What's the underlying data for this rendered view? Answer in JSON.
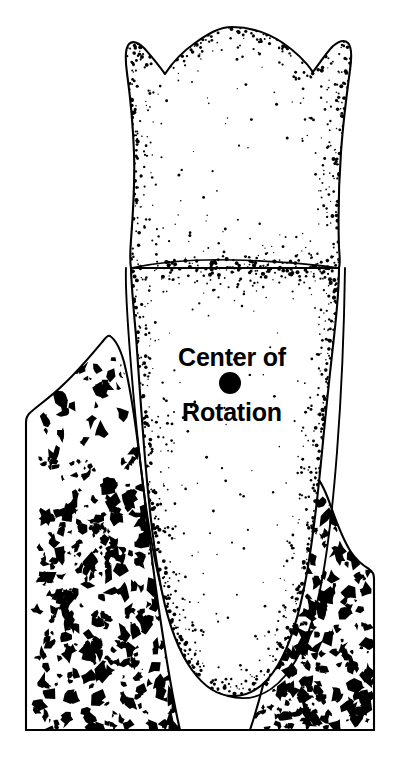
{
  "figure": {
    "title": "Center of Rotation",
    "background_color": "#ffffff",
    "ink_color": "#000000",
    "width": 397,
    "height": 781
  },
  "labels": {
    "line1": "Center of",
    "line2": "Rotation",
    "line1_x": 232,
    "line1_y": 366,
    "line2_x": 232,
    "line2_y": 421,
    "font_size": 25,
    "font_weight": "bold",
    "color": "#000000"
  },
  "marker": {
    "name": "center-of-rotation-dot",
    "shape": "filled-circle",
    "cx": 230,
    "cy": 383,
    "r": 11,
    "color": "#000000"
  },
  "parts": [
    {
      "id": "tooth-crown",
      "label": "Tooth crown",
      "fill": "#ffffff",
      "stroke": "#000000",
      "texture": "stipple"
    },
    {
      "id": "tooth-root",
      "label": "Tooth root",
      "fill": "#ffffff",
      "stroke": "#000000",
      "texture": "stipple"
    },
    {
      "id": "cementoenamel-junction",
      "label": "Neck line (cementoenamel junction)",
      "stroke": "#000000",
      "texture": "none"
    },
    {
      "id": "periodontal-ligament-space",
      "label": "Periodontal ligament space",
      "fill": "#ffffff",
      "stroke": "#000000",
      "texture": "none"
    },
    {
      "id": "alveolar-bone-left",
      "label": "Alveolar bone (left)",
      "fill": "#ffffff",
      "stroke": "#000000",
      "texture": "trabecular"
    },
    {
      "id": "alveolar-bone-right",
      "label": "Alveolar bone (right)",
      "fill": "#ffffff",
      "stroke": "#000000",
      "texture": "trabecular"
    }
  ],
  "geometry": {
    "crown_outline": "M 232 27 C 251 27 268 33 283 43 C 296 52 306 62 313 72 C 321 61 327 52 333 46 C 339 41 344 39 348 43 C 352 47 352 56 350 70 C 347 92 343 124 341 152 C 339 180 338 218 339 248 C 340 259 340 265 339 268 L 131 268 C 130 263 130 254 131 240 C 133 214 135 182 134 153 C 133 124 130 95 127 73 C 125 58 125 48 129 44 C 133 40 139 43 145 49 C 151 56 158 64 165 74 C 172 63 182 52 195 43 C 209 33 220 27 232 27 Z",
    "root_outline": "M 131 268 L 339 268 C 339 286 337 310 334 337 C 330 372 326 410 322 452 C 318 494 313 540 306 578 C 299 616 290 645 278 665 C 266 685 252 695 236 696 C 220 697 205 688 192 670 C 179 652 169 626 162 592 C 155 558 150 516 146 470 C 142 424 139 378 136 336 C 133 302 131 281 131 268 Z",
    "neck_line": "M 131 268 C 165 261 200 259 234 260 C 272 261 309 264 339 268",
    "pdl_outline": "M 126 268 C 125 290 128 330 132 378 C 136 426 141 474 148 520 C 155 566 164 606 177 638 C 190 670 207 690 228 696 C 249 702 269 695 285 676 C 301 657 312 628 320 590 C 328 552 333 504 337 452 C 341 400 344 340 345 268",
    "bone_left": "M 110 336 C 116 340 120 348 124 362 C 129 382 134 412 139 452 C 145 500 151 556 159 610 C 166 658 173 700 180 730 L 26 730 L 26 422 C 26 418 28 414 32 411 C 40 404 52 396 64 384 C 79 370 93 353 103 341 C 106 337 108 335 110 336 Z",
    "bone_right": "M 313 474 C 318 477 324 487 330 504 C 336 521 343 540 351 552 C 357 561 364 566 369 569 C 372 571 374 574 374 578 L 374 730 L 250 730 C 258 706 266 676 273 642 C 280 608 287 570 293 536 C 299 502 305 483 309 476 C 311 473 312 473 313 474 Z",
    "baseline": "M 26 730 L 374 730",
    "bone_block_bottom_y": 745
  },
  "texture_params": {
    "stipple_count": 2100,
    "stipple_min_r": 0.6,
    "stipple_max_r": 2.1,
    "trabecula_count": 520,
    "trabecula_min_r": 2.0,
    "trabecula_max_r": 7.0
  }
}
